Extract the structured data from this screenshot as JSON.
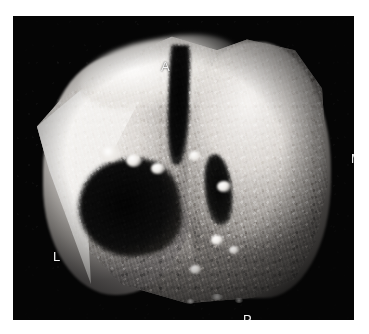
{
  "figure": {
    "kind": "3d-ultrasound-volume-render",
    "modality": "Ultrasound",
    "background_color": "#ffffff",
    "panel_color": "#050505",
    "panel": {
      "left": 13,
      "top": 16,
      "width": 341,
      "height": 304
    }
  },
  "orientation_labels": [
    {
      "id": "A",
      "text": "A",
      "meaning": "Anterior",
      "position": "top",
      "x": 148,
      "y": 44,
      "color": "#f3f3f3"
    },
    {
      "id": "M",
      "text": "M",
      "meaning": "Medial",
      "position": "right",
      "x": 338,
      "y": 136,
      "color": "#f3f3f3"
    },
    {
      "id": "L",
      "text": "L",
      "meaning": "Lateral",
      "position": "left",
      "x": 40,
      "y": 234,
      "color": "#f3f3f3"
    },
    {
      "id": "P",
      "text": "P",
      "meaning": "Posterior",
      "position": "bottom",
      "x": 230,
      "y": 297,
      "color": "#f3f3f3"
    }
  ],
  "render": {
    "description": "Tilted surface-rendered tissue slab with a central vertical cleft, a large dark cavity on the lower-left and a narrower dark slit on the right.",
    "features": [
      {
        "name": "bright-cut-facet",
        "location": "upper-left",
        "tone": "bright"
      },
      {
        "name": "central-cleft",
        "location": "top-center",
        "tone": "anechoic"
      },
      {
        "name": "left-cavity",
        "location": "center-left",
        "tone": "anechoic"
      },
      {
        "name": "right-cavity-slit",
        "location": "center-right",
        "tone": "anechoic"
      },
      {
        "name": "tissue-striations",
        "location": "throughout",
        "tone": "mid-gray"
      }
    ],
    "grayscale_range": {
      "min": "#020202",
      "max": "#fdfcfb"
    }
  }
}
